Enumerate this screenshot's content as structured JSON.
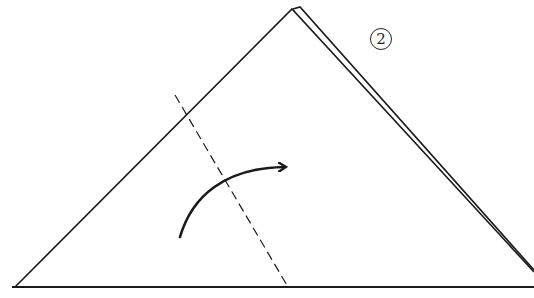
{
  "diagram": {
    "step_number": "2",
    "colors": {
      "line": "#1a1a1a",
      "background": "#ffffff"
    },
    "shapes": {
      "back_layer": {
        "points": "300,7 534,272"
      },
      "front_triangle": {
        "points": "15,287 292,9 534,270"
      },
      "baseline": {
        "x1": 12,
        "y1": 287,
        "x2": 534,
        "y2": 287
      },
      "fold_line": {
        "x1": 175,
        "y1": 95,
        "x2": 288,
        "y2": 287,
        "style": "dashed"
      },
      "fold_arrow": {
        "path": "M180,237 C192,196 225,168 284,167",
        "direction": "right"
      }
    }
  }
}
